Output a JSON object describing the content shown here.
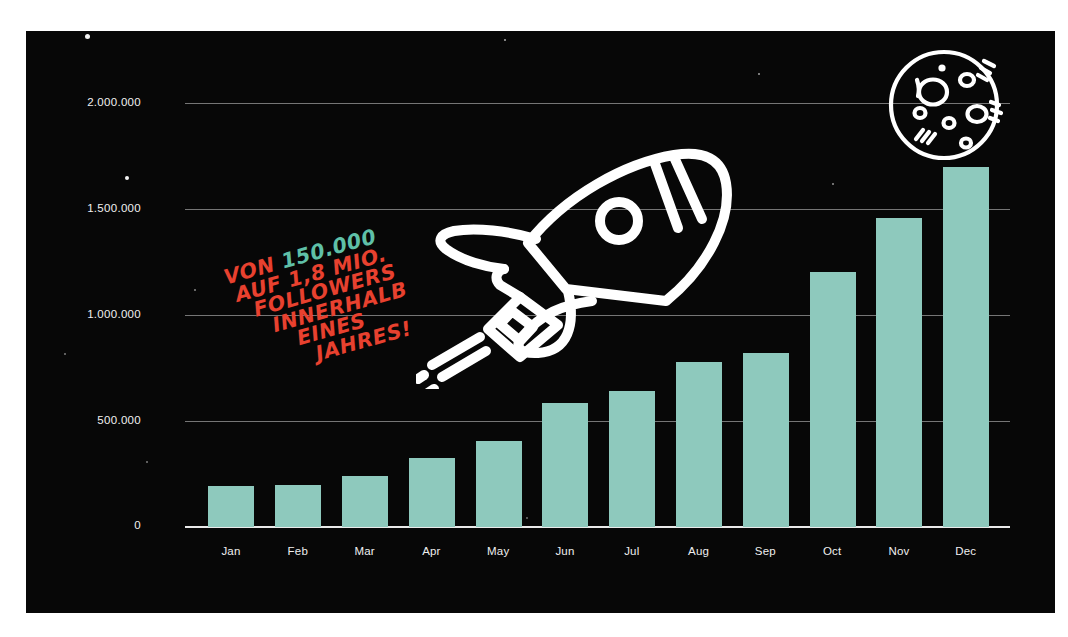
{
  "poster": {
    "background_color": "#070707",
    "bar_color": "#8ec9bd",
    "accent_red": "#e8412f",
    "accent_teal": "#5fc0a8",
    "axis_color": "#efefef"
  },
  "headline": {
    "line1_pre": "VON ",
    "line1_highlight": "150.000",
    "line2": "AUF 1,8 MIO.",
    "line3": "FOLLOWERS",
    "line4": "INNERHALB",
    "line5": "EINES",
    "line6": "JAHRES!"
  },
  "icons": {
    "rocket": "rocket-icon",
    "moon": "moon-icon"
  },
  "chart_data": {
    "type": "bar",
    "title": "",
    "xlabel": "",
    "ylabel": "",
    "grid": true,
    "legend": "none",
    "ylim": [
      0,
      2000000
    ],
    "categories": [
      "Jan",
      "Feb",
      "Mar",
      "Apr",
      "May",
      "Jun",
      "Jul",
      "Aug",
      "Sep",
      "Oct",
      "Nov",
      "Dec"
    ],
    "values": [
      195000,
      200000,
      240000,
      325000,
      405000,
      585000,
      645000,
      780000,
      825000,
      1205000,
      1460000,
      1700000
    ],
    "ytick_labels": [
      "0",
      "500.000",
      "1.000.000",
      "1.500.000",
      "2.000.000"
    ],
    "ytick_values": [
      0,
      500000,
      1000000,
      1500000,
      2000000
    ]
  }
}
